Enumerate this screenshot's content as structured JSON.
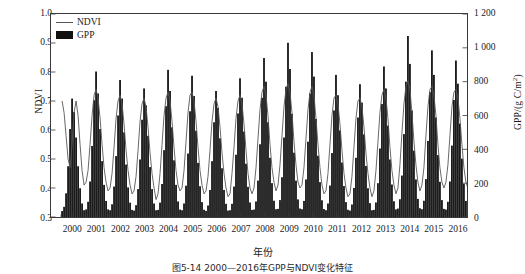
{
  "figure": {
    "caption": "图5-14  2000—2016年GPP与NDVI变化特征",
    "xlabel": "年份"
  },
  "legend": {
    "position": "top-left",
    "items": [
      {
        "label": "NDVI",
        "marker": "line",
        "color": "#555555"
      },
      {
        "label": "GPP",
        "marker": "bar",
        "color": "#111111"
      }
    ]
  },
  "chart_data": {
    "type": "line-bar-combo",
    "title": "",
    "xlabel": "年份",
    "ylabel_left": "NDVI",
    "ylabel_right": "GPP/(g C/m²)",
    "ylim_left": [
      0.3,
      1.0
    ],
    "ylim_right": [
      0,
      1200
    ],
    "yticks_left": [
      "0.3",
      "0.4",
      "0.5",
      "0.6",
      "0.7",
      "0.8",
      "0.9",
      "1.0"
    ],
    "yticks_right": [
      "0",
      "200",
      "400",
      "600",
      "800",
      "1 000",
      "1 200"
    ],
    "xticks": [
      "2000",
      "2001",
      "2002",
      "2003",
      "2004",
      "2005",
      "2006",
      "2007",
      "2008",
      "2009",
      "2010",
      "2011",
      "2012",
      "2013",
      "2014",
      "2015",
      "2016"
    ],
    "xlim": [
      1999.58,
      2016.92
    ],
    "grid": false,
    "frequency": "monthly",
    "series": [
      {
        "name": "GPP",
        "axis": "right",
        "type": "bar",
        "color": "#111111",
        "unit": "g C/m²",
        "values": [
          35,
          60,
          140,
          300,
          520,
          700,
          620,
          470,
          300,
          170,
          80,
          40,
          45,
          90,
          210,
          420,
          690,
          860,
          730,
          520,
          330,
          190,
          95,
          45,
          40,
          75,
          180,
          360,
          600,
          810,
          700,
          500,
          310,
          175,
          85,
          42,
          38,
          70,
          165,
          340,
          575,
          760,
          660,
          480,
          295,
          165,
          80,
          40,
          42,
          85,
          195,
          395,
          655,
          870,
          745,
          530,
          335,
          190,
          92,
          44,
          40,
          80,
          185,
          375,
          625,
          835,
          715,
          510,
          320,
          182,
          88,
          43,
          36,
          68,
          160,
          330,
          560,
          745,
          645,
          465,
          288,
          160,
          78,
          38,
          40,
          78,
          180,
          368,
          612,
          820,
          705,
          505,
          315,
          178,
          86,
          42,
          44,
          92,
          215,
          430,
          705,
          940,
          800,
          560,
          350,
          200,
          96,
          46,
          48,
          100,
          235,
          470,
          770,
          1030,
          875,
          610,
          380,
          215,
          104,
          50,
          46,
          95,
          222,
          445,
          730,
          975,
          830,
          580,
          362,
          206,
          99,
          47,
          40,
          80,
          186,
          378,
          630,
          840,
          720,
          512,
          322,
          183,
          88,
          43,
          38,
          74,
          172,
          350,
          588,
          785,
          676,
          488,
          302,
          170,
          82,
          40,
          42,
          86,
          200,
          405,
          668,
          890,
          760,
          540,
          340,
          192,
          93,
          45,
          50,
          105,
          245,
          490,
          800,
          1070,
          905,
          630,
          392,
          222,
          107,
          52,
          46,
          96,
          224,
          450,
          738,
          985,
          840,
          588,
          366,
          208,
          100,
          48,
          44,
          90,
          210,
          422,
          692,
          925,
          788,
          552,
          345,
          197,
          95,
          45
        ]
      },
      {
        "name": "NDVI",
        "axis": "left",
        "type": "line",
        "color": "#555555",
        "values": [
          0.7,
          0.66,
          0.58,
          0.5,
          0.47,
          0.55,
          0.66,
          0.7,
          0.65,
          0.55,
          0.46,
          0.41,
          0.42,
          0.46,
          0.55,
          0.65,
          0.72,
          0.74,
          0.71,
          0.64,
          0.55,
          0.47,
          0.42,
          0.39,
          0.4,
          0.45,
          0.54,
          0.64,
          0.7,
          0.72,
          0.69,
          0.62,
          0.53,
          0.46,
          0.41,
          0.38,
          0.39,
          0.44,
          0.53,
          0.63,
          0.69,
          0.71,
          0.68,
          0.61,
          0.52,
          0.45,
          0.4,
          0.36,
          0.38,
          0.45,
          0.55,
          0.65,
          0.71,
          0.73,
          0.7,
          0.63,
          0.54,
          0.46,
          0.41,
          0.39,
          0.4,
          0.46,
          0.56,
          0.66,
          0.72,
          0.73,
          0.7,
          0.63,
          0.54,
          0.46,
          0.41,
          0.38,
          0.39,
          0.44,
          0.53,
          0.63,
          0.69,
          0.71,
          0.68,
          0.61,
          0.52,
          0.45,
          0.4,
          0.37,
          0.38,
          0.45,
          0.54,
          0.64,
          0.7,
          0.72,
          0.69,
          0.62,
          0.53,
          0.45,
          0.4,
          0.38,
          0.4,
          0.47,
          0.57,
          0.67,
          0.73,
          0.75,
          0.72,
          0.65,
          0.55,
          0.47,
          0.42,
          0.39,
          0.41,
          0.48,
          0.58,
          0.68,
          0.74,
          0.76,
          0.73,
          0.66,
          0.56,
          0.48,
          0.42,
          0.4,
          0.41,
          0.47,
          0.57,
          0.67,
          0.73,
          0.75,
          0.72,
          0.64,
          0.55,
          0.47,
          0.41,
          0.38,
          0.39,
          0.45,
          0.55,
          0.65,
          0.71,
          0.72,
          0.69,
          0.62,
          0.53,
          0.45,
          0.4,
          0.37,
          0.38,
          0.44,
          0.54,
          0.64,
          0.7,
          0.71,
          0.68,
          0.61,
          0.52,
          0.45,
          0.4,
          0.37,
          0.39,
          0.46,
          0.56,
          0.66,
          0.72,
          0.74,
          0.71,
          0.64,
          0.54,
          0.46,
          0.41,
          0.38,
          0.4,
          0.48,
          0.59,
          0.69,
          0.75,
          0.77,
          0.74,
          0.66,
          0.56,
          0.48,
          0.42,
          0.39,
          0.41,
          0.47,
          0.58,
          0.68,
          0.74,
          0.75,
          0.72,
          0.65,
          0.55,
          0.47,
          0.42,
          0.4,
          0.42,
          0.48,
          0.58,
          0.68,
          0.73,
          0.74,
          0.71,
          0.64,
          0.55,
          0.47,
          0.42,
          0.4
        ]
      }
    ]
  }
}
